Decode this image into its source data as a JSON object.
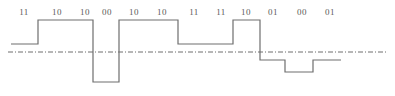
{
  "figure": {
    "name": "multilevel-signal-waveform",
    "background_color": "#ffffff",
    "line_color": "#6e6e6e",
    "axis_color": "#6e6e6e",
    "label_color": "#5a5a5a"
  },
  "symbols": [
    {
      "label": "11",
      "x": 24
    },
    {
      "label": "10",
      "x": 57
    },
    {
      "label": "10",
      "x": 85
    },
    {
      "label": "00",
      "x": 107
    },
    {
      "label": "10",
      "x": 134
    },
    {
      "label": "10",
      "x": 162
    },
    {
      "label": "11",
      "x": 194
    },
    {
      "label": "11",
      "x": 221
    },
    {
      "label": "10",
      "x": 246
    },
    {
      "label": "01",
      "x": 273
    },
    {
      "label": "00",
      "x": 302
    },
    {
      "label": "01",
      "x": 330
    }
  ],
  "chart_data": {
    "type": "line",
    "title": "",
    "xlabel": "",
    "ylabel": "",
    "grid": false,
    "legend": null,
    "zero_axis": {
      "style": "dash-dot",
      "y_pixel": 52,
      "x_start": 8,
      "x_end": 388
    },
    "level_pixels": {
      "plus2": 20,
      "plus1": 44,
      "zero": 52,
      "minus1": 60,
      "minus2": 72,
      "minus3": 82
    },
    "annotations": [
      "11",
      "10",
      "10",
      "00",
      "10",
      "10",
      "11",
      "11",
      "10",
      "01",
      "00",
      "01"
    ],
    "categories": [
      "11",
      "10",
      "10",
      "00",
      "10",
      "10",
      "11",
      "11",
      "10",
      "01",
      "00",
      "01"
    ],
    "values": [
      1,
      2,
      2,
      -3,
      2,
      2,
      1,
      1,
      2,
      -1,
      -2,
      -1
    ],
    "segments": [
      {
        "symbol": "11",
        "level": 1,
        "x_start": 11,
        "x_end": 38,
        "y": 44
      },
      {
        "symbol": "10",
        "level": 2,
        "x_start": 38,
        "x_end": 93,
        "y": 20
      },
      {
        "symbol": "00",
        "level": -3,
        "x_start": 93,
        "x_end": 119,
        "y": 82
      },
      {
        "symbol": "10",
        "level": 2,
        "x_start": 119,
        "x_end": 178,
        "y": 20
      },
      {
        "symbol": "11",
        "level": 1,
        "x_start": 178,
        "x_end": 233,
        "y": 44
      },
      {
        "symbol": "10",
        "level": 2,
        "x_start": 233,
        "x_end": 260,
        "y": 20
      },
      {
        "symbol": "01",
        "level": -1,
        "x_start": 260,
        "x_end": 285,
        "y": 60
      },
      {
        "symbol": "00",
        "level": -2,
        "x_start": 285,
        "x_end": 313,
        "y": 72
      },
      {
        "symbol": "01",
        "level": -1,
        "x_start": 313,
        "x_end": 341,
        "y": 60
      }
    ],
    "path_d": "M 11 44 L 38 44 L 38 20 L 93 20 L 93 82 L 119 82 L 119 20 L 178 20 L 178 44 L 233 44 L 233 20 L 260 20 L 260 60 L 285 60 L 285 72 L 313 72 L 313 60 L 341 60"
  }
}
